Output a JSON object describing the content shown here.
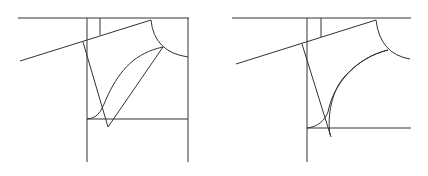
{
  "figures": [
    {
      "name": "pattern-draft-left",
      "description": "Sleeve/armhole pattern draft with straight-line construction"
    },
    {
      "name": "pattern-draft-right",
      "description": "Sleeve/armhole pattern draft with curved construction"
    }
  ],
  "colors": {
    "line": "#333333",
    "background": "#ffffff"
  }
}
